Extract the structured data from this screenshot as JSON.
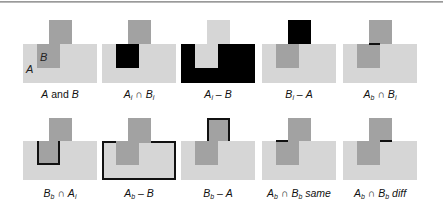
{
  "figure": {
    "colors": {
      "a_fill": "#d6d6d6",
      "b_fill": "#a2a2a2",
      "highlight": "#000000",
      "edge": "#111111"
    },
    "shape_letters": {
      "a": "A",
      "b": "B"
    },
    "panels": [
      {
        "id": "a-and-b",
        "label_parts": [
          "A",
          " and ",
          "B"
        ]
      },
      {
        "id": "ai-cap-bi",
        "label_parts": [
          "A",
          "i",
          " ∩ ",
          "B",
          "i"
        ]
      },
      {
        "id": "ai-minus-b",
        "label_parts": [
          "A",
          "i",
          " – ",
          "B"
        ]
      },
      {
        "id": "bi-minus-a",
        "label_parts": [
          "B",
          "i",
          " – ",
          "A"
        ]
      },
      {
        "id": "ab-cap-bi",
        "label_parts": [
          "A",
          "b",
          " ∩ ",
          "B",
          "i"
        ]
      },
      {
        "id": "bb-cap-ai",
        "label_parts": [
          "B",
          "b",
          " ∩ ",
          "A",
          "i"
        ]
      },
      {
        "id": "ab-minus-b",
        "label_parts": [
          "A",
          "b",
          " – ",
          "B"
        ]
      },
      {
        "id": "bb-minus-a",
        "label_parts": [
          "B",
          "b",
          " – ",
          "A"
        ]
      },
      {
        "id": "ab-cap-bb-same",
        "label_parts": [
          "A",
          "b",
          " ∩ ",
          "B",
          "b",
          " same"
        ]
      },
      {
        "id": "ab-cap-bb-diff",
        "label_parts": [
          "A",
          "b",
          " ∩ ",
          "B",
          "b",
          " diff"
        ]
      }
    ]
  }
}
